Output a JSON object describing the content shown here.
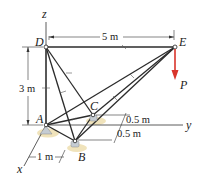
{
  "figure": {
    "points": {
      "A": {
        "label": "A",
        "x": 46,
        "y": 125
      },
      "B": {
        "label": "B",
        "x": 75,
        "y": 141
      },
      "C": {
        "label": "C",
        "x": 93,
        "y": 115
      },
      "D": {
        "label": "D",
        "x": 46,
        "y": 47
      },
      "E": {
        "label": "E",
        "x": 175,
        "y": 47
      }
    },
    "axes": {
      "x": "x",
      "y": "y",
      "z": "z"
    },
    "dimensions": {
      "DE": "5 m",
      "AD": "3 m",
      "offset_C": "0.5 m",
      "offset_B": "0.5 m",
      "AB_x": "1 m"
    },
    "load": {
      "label": "P",
      "color": "#d9342b"
    },
    "members": [
      "DE",
      "DA",
      "DB",
      "DC",
      "EA",
      "EB",
      "EC",
      "AB",
      "AC",
      "BC"
    ],
    "colors": {
      "member": "#2b2b2b",
      "dimension_line": "#333333",
      "support_shadow": "#e8d9a6",
      "support": "#b8c0c8",
      "load_arrow": "#d9342b"
    }
  }
}
